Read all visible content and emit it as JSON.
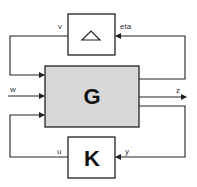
{
  "diagram": {
    "type": "LFT feedback interconnection",
    "blocks": {
      "delta": {
        "label": "",
        "icon": "triangle-delta-icon"
      },
      "plant": {
        "label": "G",
        "fill": "#d8d8d8"
      },
      "controller": {
        "label": "K",
        "fill": "#ffffff"
      }
    },
    "signals": {
      "v": "v",
      "eta": "eta",
      "w": "w",
      "z": "z",
      "u": "u",
      "y": "y"
    },
    "colors": {
      "line": "#222222",
      "plant_fill": "#d8d8d8",
      "background": "#ffffff"
    }
  }
}
